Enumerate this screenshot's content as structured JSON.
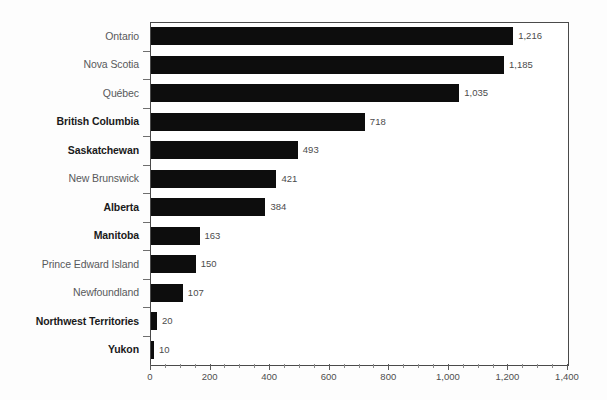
{
  "chart_data": {
    "type": "bar",
    "orientation": "horizontal",
    "title": "",
    "subtitle": "",
    "xlabel": "",
    "ylabel": "",
    "xlim": [
      0,
      1400
    ],
    "x_tick_step": 200,
    "x_minor_tick_step": 50,
    "grid": false,
    "legend": null,
    "bar_color": "#0d0d0d",
    "categories": [
      "Ontario",
      "Nova Scotia",
      "Québec",
      "British Columbia",
      "Saskatchewan",
      "New Brunswick",
      "Alberta",
      "Manitoba",
      "Prince Edward Island",
      "Newfoundland",
      "Northwest Territories",
      "Yukon"
    ],
    "values": [
      1216,
      1185,
      1035,
      718,
      493,
      421,
      384,
      163,
      150,
      107,
      20,
      10
    ],
    "value_labels": [
      "1,216",
      "1,185",
      "1,035",
      "718",
      "493",
      "421",
      "384",
      "163",
      "150",
      "107",
      "20",
      "10"
    ],
    "category_emphasis": [
      false,
      false,
      false,
      true,
      true,
      false,
      true,
      true,
      false,
      false,
      true,
      true
    ],
    "x_tick_labels": [
      "0",
      "200",
      "400",
      "600",
      "800",
      "1,000",
      "1,200",
      "1,400"
    ],
    "x_tick_values": [
      0,
      200,
      400,
      600,
      800,
      1000,
      1200,
      1400
    ]
  }
}
